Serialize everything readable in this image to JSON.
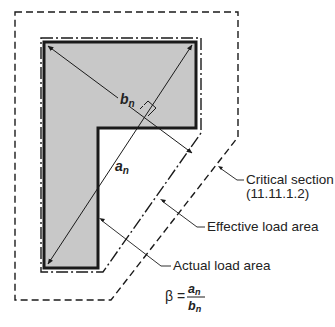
{
  "colors": {
    "fill": "#c8c8c8",
    "stroke": "#1a1a1a",
    "text": "#222222",
    "background": "#ffffff"
  },
  "labels": {
    "bn": "b",
    "bn_sub": "n",
    "an": "a",
    "an_sub": "n",
    "critical_section_line1": "Critical section",
    "critical_section_line2": "(11.11.1.2)",
    "effective_load_area": "Effective load area",
    "actual_load_area": "Actual load area"
  },
  "formula": {
    "lhs": "β =",
    "numerator": "a",
    "numerator_sub": "n",
    "denominator": "b",
    "denominator_sub": "n"
  }
}
